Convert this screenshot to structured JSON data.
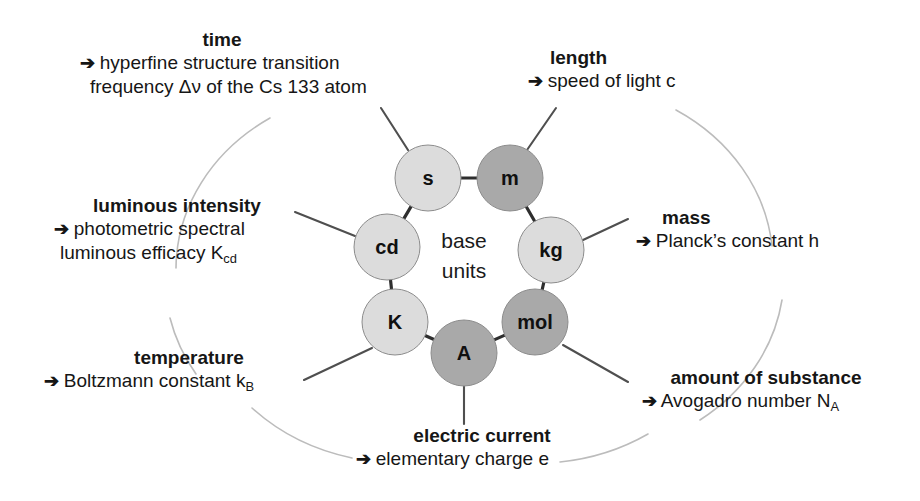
{
  "diagram": {
    "center_label_line1": "base",
    "center_label_line2": "units",
    "arrow_glyph": "➔",
    "colors": {
      "node_light": "#dcdcdc",
      "node_dark": "#a9a9a9",
      "node_stroke": "#8c8c8c",
      "spoke": "#4a4a4a",
      "background_arc": "#b9b9b9",
      "text": "#161616",
      "page_background": "#ffffff"
    },
    "nodes": [
      {
        "id": "s",
        "label": "s",
        "shade": "light",
        "cx": 428,
        "cy": 178,
        "r": 33
      },
      {
        "id": "m",
        "label": "m",
        "shade": "dark",
        "cx": 510,
        "cy": 178,
        "r": 33
      },
      {
        "id": "cd",
        "label": "cd",
        "shade": "light",
        "cx": 387,
        "cy": 247,
        "r": 33
      },
      {
        "id": "kg",
        "label": "kg",
        "shade": "light",
        "cx": 551,
        "cy": 250,
        "r": 33
      },
      {
        "id": "K",
        "label": "K",
        "shade": "light",
        "cx": 395,
        "cy": 322,
        "r": 33
      },
      {
        "id": "mol",
        "label": "mol",
        "shade": "dark",
        "cx": 535,
        "cy": 322,
        "r": 33
      },
      {
        "id": "A",
        "label": "A",
        "shade": "dark",
        "cx": 464,
        "cy": 353,
        "r": 33
      }
    ],
    "labels": [
      {
        "id": "time",
        "title": "time",
        "lines": [
          "hyperfine structure transition",
          "frequency Δν of the Cs 133 atom"
        ],
        "quantity": "time",
        "constant": "hyperfine structure transition frequency Δν of the Cs 133 atom",
        "node": "s"
      },
      {
        "id": "length",
        "title": "length",
        "lines": [
          "speed of light c"
        ],
        "quantity": "length",
        "constant": "speed of light c",
        "node": "m"
      },
      {
        "id": "luminous_intensity",
        "title": "luminous intensity",
        "lines": [
          "photometric spectral",
          "luminous efficacy K"
        ],
        "subscript_last": "cd",
        "quantity": "luminous intensity",
        "constant": "photometric spectral luminous efficacy K_cd",
        "node": "cd"
      },
      {
        "id": "mass",
        "title": "mass",
        "lines": [
          "Planck’s constant h"
        ],
        "quantity": "mass",
        "constant": "Planck’s constant h",
        "node": "kg"
      },
      {
        "id": "temperature",
        "title": "temperature",
        "lines": [
          "Boltzmann constant k"
        ],
        "subscript_last": "B",
        "quantity": "temperature",
        "constant": "Boltzmann constant k_B",
        "node": "K"
      },
      {
        "id": "amount_of_substance",
        "title": "amount of substance",
        "lines": [
          "Avogadro number N"
        ],
        "subscript_last": "A",
        "quantity": "amount of substance",
        "constant": "Avogadro number N_A",
        "node": "mol"
      },
      {
        "id": "electric_current",
        "title": "electric current",
        "lines": [
          "elementary charge e"
        ],
        "quantity": "electric current",
        "constant": "elementary charge e",
        "node": "A"
      }
    ]
  }
}
